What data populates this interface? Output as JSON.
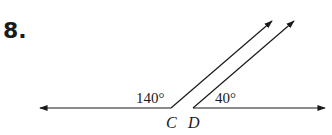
{
  "problem": {
    "number": "8."
  },
  "diagram": {
    "angles": [
      {
        "label": "140°",
        "at": "C"
      },
      {
        "label": "40°",
        "at": "D"
      }
    ],
    "points": [
      {
        "name": "C"
      },
      {
        "name": "D"
      }
    ],
    "colors": {
      "stroke": "#1a1a1a"
    }
  }
}
